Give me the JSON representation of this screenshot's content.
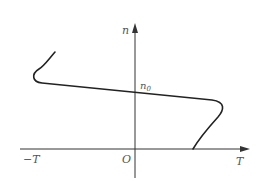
{
  "diagram": {
    "type": "curve-sketch",
    "axes": {
      "x_label": "T",
      "y_label": "n",
      "origin_label": "O",
      "x_negative_label": "−T",
      "y_intercept_label": "n",
      "y_intercept_subscript": "0"
    },
    "curve": {
      "description": "Z-shaped curve: starts upper-left, hooks left, descends gently across the y-axis at n0, hooks right, then drops to meet the T-axis at a positive value",
      "color": "#222222"
    },
    "colors": {
      "axis": "#333333",
      "label": "#555555",
      "background": "#ffffff"
    }
  }
}
